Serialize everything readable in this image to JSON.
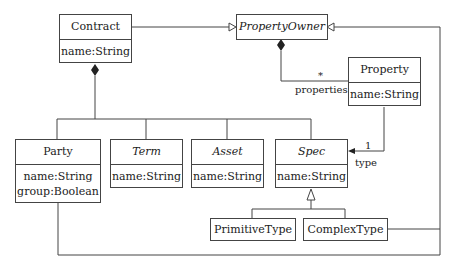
{
  "diagram": {
    "type": "UML class diagram",
    "classes": [
      {
        "id": "contract",
        "name": "Contract",
        "abstract": false,
        "attributes": [
          "name:String"
        ]
      },
      {
        "id": "property_owner",
        "name": "PropertyOwner",
        "abstract": true,
        "attributes": []
      },
      {
        "id": "property",
        "name": "Property",
        "abstract": false,
        "attributes": [
          "name:String"
        ]
      },
      {
        "id": "party",
        "name": "Party",
        "abstract": false,
        "attributes": [
          "name:String",
          "group:Boolean"
        ]
      },
      {
        "id": "term",
        "name": "Term",
        "abstract": true,
        "attributes": [
          "name:String"
        ]
      },
      {
        "id": "asset",
        "name": "Asset",
        "abstract": true,
        "attributes": [
          "name:String"
        ]
      },
      {
        "id": "spec",
        "name": "Spec",
        "abstract": true,
        "attributes": [
          "name:String"
        ]
      },
      {
        "id": "primitive_type",
        "name": "PrimitiveType",
        "abstract": false,
        "attributes": []
      },
      {
        "id": "complex_type",
        "name": "ComplexType",
        "abstract": false,
        "attributes": []
      }
    ],
    "relations": [
      {
        "kind": "generalization",
        "from": "Contract",
        "to": "PropertyOwner"
      },
      {
        "kind": "generalization",
        "from": "Party",
        "to": "PropertyOwner"
      },
      {
        "kind": "generalization",
        "from": "ComplexType",
        "to": "PropertyOwner"
      },
      {
        "kind": "composition",
        "whole": "Contract",
        "parts": [
          "Party",
          "Term",
          "Asset",
          "Spec"
        ]
      },
      {
        "kind": "composition",
        "whole": "PropertyOwner",
        "part": "Property",
        "role": "properties",
        "multiplicity": "*"
      },
      {
        "kind": "association",
        "from": "Property",
        "to": "Spec",
        "role": "type",
        "multiplicity": "1"
      },
      {
        "kind": "generalization",
        "from": "PrimitiveType",
        "to": "Spec"
      },
      {
        "kind": "generalization",
        "from": "ComplexType",
        "to": "Spec"
      }
    ],
    "labels": {
      "properties_role": "properties",
      "properties_mult": "*",
      "type_role": "type",
      "type_mult": "1"
    }
  }
}
